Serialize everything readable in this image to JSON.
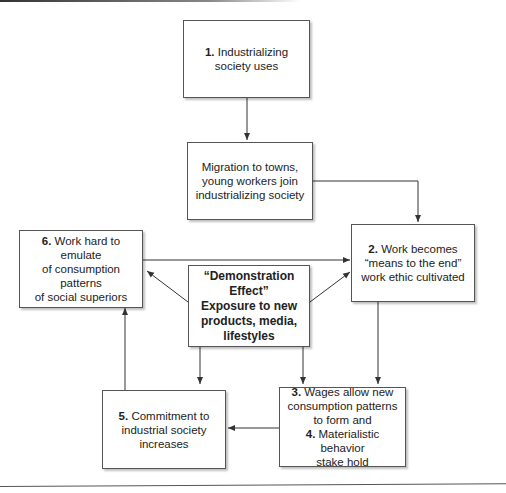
{
  "diagram": {
    "boxes": {
      "b1": {
        "num": "1.",
        "text": "Industrializing society uses"
      },
      "migration": {
        "text": "Migration to towns, young workers join industrializing society"
      },
      "b2": {
        "num": "2.",
        "line1": "Work becomes",
        "line2": "“means to the end”",
        "line3": "work ethic cultivated"
      },
      "b6": {
        "num": "6.",
        "line1": "Work hard to emulate",
        "line2": "of consumption patterns",
        "line3": "of social superiors"
      },
      "center": {
        "line1": "“Demonstration Effect”",
        "line2": "Exposure to new",
        "line3": "products, media,",
        "line4": "lifestyles"
      },
      "b5": {
        "num": "5.",
        "line1": "Commitment to",
        "line2": "industrial society",
        "line3": "increases"
      },
      "b34": {
        "num3": "3.",
        "line1": "Wages allow new",
        "line2": "consumption patterns",
        "line3": "to form and",
        "num4": "4.",
        "line4": "Materialistic behavior",
        "line5": "stake hold"
      }
    },
    "colors": {
      "stroke": "#333333",
      "box_border": "#555555"
    }
  }
}
